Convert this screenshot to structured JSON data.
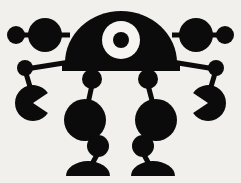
{
  "artwork": {
    "title": "One-eyed robot silhouette",
    "subject": "robot",
    "style": "flat black silhouette clip art",
    "background_color": "#f2f0ec",
    "ink_color": "#0b0b0b",
    "eye_color": "#f7f5f1",
    "canvas": {
      "width": 241,
      "height": 183
    }
  },
  "parts": {
    "head": {
      "name": "dome-head",
      "shape": "semicircle",
      "center_x": 121,
      "base_y": 63,
      "radius_x": 56,
      "radius_y": 52
    },
    "neck_bar": {
      "name": "head-base-bar",
      "x": 62,
      "y": 63,
      "width": 118,
      "height": 8
    },
    "eye": {
      "name": "single-eye",
      "center_x": 121,
      "center_y": 40,
      "outer_radius": 19,
      "inner_radius": 8,
      "ring_color": "#f7f5f1",
      "pupil_color": "#0b0b0b"
    },
    "antennae": [
      {
        "name": "left-antenna",
        "side": "left",
        "bar": {
          "x1": 16,
          "y1": 35,
          "x2": 70,
          "y2": 35,
          "thickness": 5
        },
        "inner_circle": {
          "cx": 45,
          "cy": 35,
          "r": 17
        },
        "tip_circle": {
          "cx": 16,
          "cy": 35,
          "r": 9
        }
      },
      {
        "name": "right-antenna",
        "side": "right",
        "bar": {
          "x1": 225,
          "y1": 35,
          "x2": 172,
          "y2": 35,
          "thickness": 5
        },
        "inner_circle": {
          "cx": 196,
          "cy": 35,
          "r": 17
        },
        "tip_circle": {
          "cx": 225,
          "cy": 35,
          "r": 9
        }
      }
    ],
    "arms": [
      {
        "name": "left-arm",
        "side": "left",
        "upper_bar": {
          "x1": 70,
          "y1": 62,
          "x2": 26,
          "y2": 69,
          "thickness": 5
        },
        "elbow": {
          "cx": 25,
          "cy": 68,
          "r": 8
        },
        "forearm": {
          "x1": 25,
          "y1": 70,
          "x2": 31,
          "y2": 90,
          "thickness": 5
        },
        "claw": {
          "cx": 33,
          "cy": 103,
          "r": 18,
          "notch": "wedge open to the right",
          "notch_start_deg": -34,
          "notch_end_deg": 34
        }
      },
      {
        "name": "right-arm",
        "side": "right",
        "upper_bar": {
          "x1": 172,
          "y1": 62,
          "x2": 215,
          "y2": 69,
          "thickness": 5
        },
        "elbow": {
          "cx": 216,
          "cy": 68,
          "r": 8
        },
        "forearm": {
          "x1": 216,
          "y1": 70,
          "x2": 210,
          "y2": 90,
          "thickness": 5
        },
        "claw": {
          "cx": 208,
          "cy": 103,
          "r": 18,
          "notch": "wedge open to the left",
          "notch_start_deg": 146,
          "notch_end_deg": 214
        }
      }
    ],
    "legs": [
      {
        "name": "left-leg",
        "side": "left",
        "hip": {
          "cx": 92,
          "cy": 79,
          "r": 10
        },
        "thigh": {
          "x1": 92,
          "y1": 85,
          "x2": 87,
          "y2": 108,
          "thickness": 5
        },
        "knee": {
          "cx": 85,
          "cy": 120,
          "r": 21
        },
        "shin": {
          "x1": 88,
          "y1": 136,
          "x2": 95,
          "y2": 143,
          "thickness": 5
        },
        "ankle": {
          "cx": 98,
          "cy": 146,
          "r": 11
        },
        "lower_shin": {
          "x1": 98,
          "y1": 153,
          "x2": 92,
          "y2": 164,
          "thickness": 5
        },
        "foot": {
          "cx": 88,
          "cy": 176,
          "rx": 22,
          "ry": 15,
          "shape": "half-dome"
        }
      },
      {
        "name": "right-leg",
        "side": "right",
        "hip": {
          "cx": 148,
          "cy": 79,
          "r": 10
        },
        "thigh": {
          "x1": 148,
          "y1": 85,
          "x2": 154,
          "y2": 108,
          "thickness": 5
        },
        "knee": {
          "cx": 156,
          "cy": 120,
          "r": 21
        },
        "shin": {
          "x1": 153,
          "y1": 136,
          "x2": 146,
          "y2": 143,
          "thickness": 5
        },
        "ankle": {
          "cx": 143,
          "cy": 146,
          "r": 11
        },
        "lower_shin": {
          "x1": 143,
          "y1": 153,
          "x2": 149,
          "y2": 164,
          "thickness": 5
        },
        "foot": {
          "cx": 153,
          "cy": 176,
          "rx": 22,
          "ry": 15,
          "shape": "half-dome"
        }
      }
    ]
  }
}
